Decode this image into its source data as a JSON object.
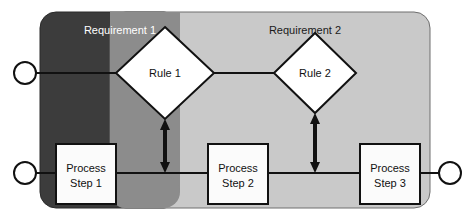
{
  "diagram": {
    "canvas": {
      "width": 475,
      "height": 224,
      "background": "#ffffff"
    },
    "regions": [
      {
        "id": "requirement-1",
        "label": "Requirement 1",
        "label_color": "#ffffff",
        "fill": "#3c3c3c",
        "x": 40,
        "y": 12,
        "width": 140,
        "height": 196,
        "radius": 16
      },
      {
        "id": "requirement-2",
        "label": "Requirement 2",
        "label_color": "#1a1a1a",
        "fill": "#c9c9c9",
        "x": 110,
        "y": 12,
        "width": 320,
        "height": 196,
        "radius": 16
      }
    ],
    "overlap": {
      "id": "requirement-overlap",
      "fill": "#8c8c8c",
      "x": 110,
      "y": 12,
      "width": 70,
      "height": 196
    },
    "connectors": [
      {
        "id": "start-rule-circle",
        "shape": "circle",
        "cx": 25,
        "cy": 73,
        "r": 11
      },
      {
        "id": "start-process-circle",
        "shape": "circle",
        "cx": 25,
        "cy": 173,
        "r": 11
      },
      {
        "id": "end-process-circle",
        "shape": "circle",
        "cx": 450,
        "cy": 173,
        "r": 11
      }
    ],
    "decisions": [
      {
        "id": "rule-1",
        "label": "Rule 1",
        "cx": 165,
        "cy": 73,
        "half_width": 49,
        "half_height": 46,
        "fill": "#ffffff",
        "stroke": "#111111"
      },
      {
        "id": "rule-2",
        "label": "Rule 2",
        "cx": 315,
        "cy": 73,
        "half_width": 41,
        "half_height": 40,
        "fill": "#ffffff",
        "stroke": "#111111"
      }
    ],
    "process_steps": [
      {
        "id": "process-step-1",
        "line1": "Process",
        "line2": "Step 1",
        "x": 56,
        "y": 144,
        "width": 60,
        "height": 60,
        "fill": "#fbfbfb",
        "stroke": "#111111"
      },
      {
        "id": "process-step-2",
        "line1": "Process",
        "line2": "Step 2",
        "x": 208,
        "y": 144,
        "width": 60,
        "height": 60,
        "fill": "#fbfbfb",
        "stroke": "#111111"
      },
      {
        "id": "process-step-3",
        "line1": "Process",
        "line2": "Step 3",
        "x": 360,
        "y": 144,
        "width": 60,
        "height": 60,
        "fill": "#fbfbfb",
        "stroke": "#111111"
      }
    ],
    "flow_lines": [
      {
        "id": "flow-start-to-rule-1",
        "x1": 36,
        "y1": 73,
        "x2": 116,
        "y2": 73
      },
      {
        "id": "flow-rule-1-to-rule-2",
        "x1": 214,
        "y1": 73,
        "x2": 274,
        "y2": 73
      },
      {
        "id": "flow-start-to-step-1",
        "x1": 36,
        "y1": 173,
        "x2": 56,
        "y2": 173
      },
      {
        "id": "flow-step-1-to-step-2",
        "x1": 116,
        "y1": 173,
        "x2": 208,
        "y2": 173
      },
      {
        "id": "flow-step-2-to-step-3",
        "x1": 268,
        "y1": 173,
        "x2": 360,
        "y2": 173
      },
      {
        "id": "flow-step-3-to-end",
        "x1": 420,
        "y1": 173,
        "x2": 439,
        "y2": 173
      }
    ],
    "trace_arrows": [
      {
        "id": "trace-rule-1-to-step-row",
        "x": 165,
        "y1": 119,
        "y2": 173
      },
      {
        "id": "trace-rule-2-to-step-row",
        "x": 315,
        "y1": 113,
        "y2": 173
      }
    ],
    "stroke_color": "#111111",
    "line_width": 2
  }
}
